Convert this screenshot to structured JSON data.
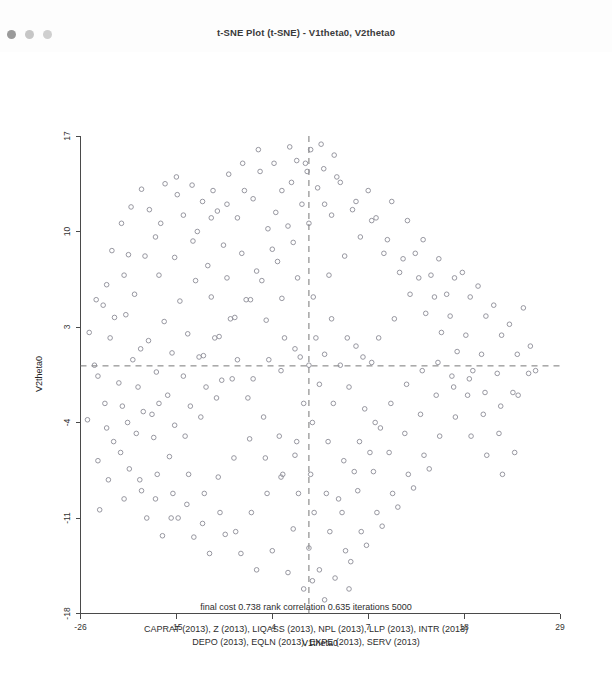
{
  "window": {
    "title": "t-SNE Plot (t-SNE) - V1theta0, V2theta0",
    "controls": [
      {
        "name": "close",
        "color": "#9a9a9a"
      },
      {
        "name": "minimize",
        "color": "#c6c6c6"
      },
      {
        "name": "maximize",
        "color": "#cfcfcf"
      }
    ]
  },
  "footer": {
    "stats_line": "final cost  0.738   rank correlation  0.635   iterations  5000",
    "variables_line_1": "CAPRAT (2013), Z (2013), LIQASS (2013), NPL (2013), LLP (2013), INTR (2013)",
    "variables_line_2": "DEPO (2013), EQLN (2013), EXPE (2013), SERV (2013)"
  },
  "chart_data": {
    "type": "scatter",
    "title": "t-SNE Plot (t-SNE) - V1theta0, V2theta0",
    "xlabel": "V1theta0",
    "ylabel": "V2theta0",
    "xlim": [
      -26,
      29
    ],
    "ylim": [
      -18,
      17
    ],
    "xticks": [
      -26,
      -15,
      -4,
      7,
      18,
      29
    ],
    "xticklabels": [
      "-26",
      "-15",
      "-4",
      "7",
      "18",
      "29"
    ],
    "yticks": [
      -18,
      -11,
      -4,
      3,
      10,
      17
    ],
    "yticklabels": [
      "-18",
      "-11",
      "-4",
      "3",
      "10",
      "17"
    ],
    "grid": false,
    "legend": null,
    "marker": "open-circle",
    "marker_color": "#8c8c96",
    "reference_lines": [
      {
        "orientation": "vertical",
        "x": 0.2,
        "style": "dashed"
      },
      {
        "orientation": "horizontal",
        "y": 0.15,
        "style": "dashed"
      }
    ],
    "annotations": [
      "final cost  0.738   rank correlation  0.635   iterations  5000",
      "CAPRAT (2013), Z (2013), LIQASS (2013), NPL (2013), LLP (2013), INTR (2013)",
      "DEPO (2013), EQLN (2013), EXPE (2013), SERV (2013)"
    ],
    "n_points": 268,
    "points": [
      [
        -19.0,
        13.1
      ],
      [
        -16.3,
        13.5
      ],
      [
        -21.3,
        10.6
      ],
      [
        -18.1,
        11.6
      ],
      [
        -14.9,
        12.7
      ],
      [
        -12.0,
        12.2
      ],
      [
        -10.3,
        11.5
      ],
      [
        -17.4,
        9.6
      ],
      [
        -20.5,
        8.3
      ],
      [
        -23.0,
        6.1
      ],
      [
        -22.1,
        3.7
      ],
      [
        -19.8,
        5.4
      ],
      [
        -17.0,
        6.8
      ],
      [
        -15.2,
        8.1
      ],
      [
        -13.1,
        9.3
      ],
      [
        -11.4,
        7.5
      ],
      [
        -9.6,
        9.0
      ],
      [
        -8.0,
        11.0
      ],
      [
        -6.2,
        12.4
      ],
      [
        -4.5,
        10.2
      ],
      [
        -2.9,
        13.0
      ],
      [
        -1.2,
        15.2
      ],
      [
        0.4,
        16.0
      ],
      [
        1.9,
        14.6
      ],
      [
        3.1,
        15.6
      ],
      [
        -0.6,
        12.0
      ],
      [
        -2.2,
        10.4
      ],
      [
        -4.0,
        8.7
      ],
      [
        -5.8,
        7.1
      ],
      [
        -7.5,
        8.4
      ],
      [
        -9.2,
        6.6
      ],
      [
        -11.0,
        5.2
      ],
      [
        -12.8,
        6.4
      ],
      [
        -14.6,
        4.9
      ],
      [
        -16.4,
        3.4
      ],
      [
        -18.2,
        2.0
      ],
      [
        -20.0,
        0.6
      ],
      [
        -21.6,
        -1.1
      ],
      [
        -23.2,
        -2.6
      ],
      [
        -24.4,
        0.2
      ],
      [
        -22.6,
        2.2
      ],
      [
        -20.8,
        3.9
      ],
      [
        -19.1,
        1.4
      ],
      [
        -17.3,
        -0.3
      ],
      [
        -15.5,
        1.1
      ],
      [
        -13.7,
        2.5
      ],
      [
        -11.9,
        0.9
      ],
      [
        -10.1,
        2.3
      ],
      [
        -8.3,
        3.7
      ],
      [
        -6.5,
        5.0
      ],
      [
        -4.7,
        3.5
      ],
      [
        -2.9,
        5.1
      ],
      [
        -1.1,
        6.6
      ],
      [
        0.7,
        5.2
      ],
      [
        2.5,
        6.8
      ],
      [
        4.3,
        8.2
      ],
      [
        6.1,
        9.6
      ],
      [
        7.9,
        11.0
      ],
      [
        9.7,
        12.2
      ],
      [
        11.5,
        10.8
      ],
      [
        13.3,
        9.4
      ],
      [
        15.1,
        8.0
      ],
      [
        16.9,
        6.6
      ],
      [
        18.7,
        5.2
      ],
      [
        20.5,
        3.8
      ],
      [
        22.3,
        2.4
      ],
      [
        24.1,
        1.0
      ],
      [
        25.4,
        -0.4
      ],
      [
        23.6,
        -1.8
      ],
      [
        21.8,
        -0.4
      ],
      [
        20.0,
        1.0
      ],
      [
        18.2,
        2.4
      ],
      [
        16.4,
        3.8
      ],
      [
        14.6,
        5.2
      ],
      [
        12.8,
        6.6
      ],
      [
        11.0,
        8.0
      ],
      [
        9.2,
        9.4
      ],
      [
        7.4,
        10.8
      ],
      [
        5.6,
        12.2
      ],
      [
        3.8,
        13.6
      ],
      [
        2.0,
        12.0
      ],
      [
        0.2,
        10.6
      ],
      [
        -1.6,
        9.2
      ],
      [
        -3.4,
        7.8
      ],
      [
        -5.2,
        6.4
      ],
      [
        -7.0,
        5.0
      ],
      [
        -8.8,
        3.6
      ],
      [
        -10.6,
        2.2
      ],
      [
        -12.4,
        0.8
      ],
      [
        -14.2,
        -0.6
      ],
      [
        -16.0,
        -2.0
      ],
      [
        -17.8,
        -3.4
      ],
      [
        -19.6,
        -4.8
      ],
      [
        -21.4,
        -6.2
      ],
      [
        -23.0,
        -4.4
      ],
      [
        -21.2,
        -2.8
      ],
      [
        -19.4,
        -1.4
      ],
      [
        -17.6,
        -5.1
      ],
      [
        -15.8,
        -6.5
      ],
      [
        -14.0,
        -5.0
      ],
      [
        -12.2,
        -3.6
      ],
      [
        -10.4,
        -2.2
      ],
      [
        -8.6,
        -0.8
      ],
      [
        -6.8,
        -2.2
      ],
      [
        -5.0,
        -3.6
      ],
      [
        -3.2,
        -5.0
      ],
      [
        -1.4,
        -6.4
      ],
      [
        0.4,
        -7.8
      ],
      [
        2.2,
        -9.2
      ],
      [
        4.0,
        -10.6
      ],
      [
        5.8,
        -9.0
      ],
      [
        7.6,
        -7.6
      ],
      [
        9.4,
        -6.2
      ],
      [
        11.2,
        -4.8
      ],
      [
        13.0,
        -3.4
      ],
      [
        14.8,
        -2.0
      ],
      [
        16.6,
        -0.6
      ],
      [
        18.4,
        -2.0
      ],
      [
        20.2,
        -3.4
      ],
      [
        22.0,
        -4.8
      ],
      [
        23.8,
        -6.2
      ],
      [
        22.4,
        -7.8
      ],
      [
        20.6,
        -6.4
      ],
      [
        18.8,
        -5.0
      ],
      [
        17.0,
        -3.6
      ],
      [
        15.2,
        -5.0
      ],
      [
        13.4,
        -6.4
      ],
      [
        11.6,
        -7.8
      ],
      [
        9.8,
        -9.2
      ],
      [
        8.0,
        -10.6
      ],
      [
        6.2,
        -12.0
      ],
      [
        4.4,
        -13.4
      ],
      [
        2.6,
        -12.0
      ],
      [
        0.8,
        -10.6
      ],
      [
        -1.0,
        -9.2
      ],
      [
        -2.8,
        -7.8
      ],
      [
        -4.6,
        -9.2
      ],
      [
        -6.4,
        -10.6
      ],
      [
        -8.2,
        -12.0
      ],
      [
        -10.0,
        -10.6
      ],
      [
        -11.8,
        -9.2
      ],
      [
        -13.6,
        -7.8
      ],
      [
        -15.4,
        -9.2
      ],
      [
        -17.2,
        -7.8
      ],
      [
        -19.0,
        -9.0
      ],
      [
        -20.4,
        -7.4
      ],
      [
        -18.4,
        -11.0
      ],
      [
        -16.6,
        -12.3
      ],
      [
        -14.8,
        -11.0
      ],
      [
        -13.0,
        -12.4
      ],
      [
        -11.2,
        -13.6
      ],
      [
        -9.4,
        -12.2
      ],
      [
        -7.6,
        -13.6
      ],
      [
        -5.8,
        -14.8
      ],
      [
        -4.0,
        -13.4
      ],
      [
        -2.2,
        -15.0
      ],
      [
        -0.4,
        -16.2
      ],
      [
        1.4,
        -14.8
      ],
      [
        3.2,
        -15.4
      ],
      [
        5.0,
        -14.2
      ],
      [
        6.8,
        -13.0
      ],
      [
        8.6,
        -11.6
      ],
      [
        10.4,
        -10.2
      ],
      [
        12.2,
        -8.8
      ],
      [
        14.0,
        -7.4
      ],
      [
        -24.0,
        -0.6
      ],
      [
        -25.0,
        2.6
      ],
      [
        -23.4,
        4.6
      ],
      [
        -21.0,
        6.8
      ],
      [
        -18.6,
        8.2
      ],
      [
        -16.8,
        10.6
      ],
      [
        -14.2,
        11.2
      ],
      [
        -12.6,
        10.0
      ],
      [
        -10.8,
        13.0
      ],
      [
        -9.0,
        14.2
      ],
      [
        -7.2,
        13.0
      ],
      [
        -5.4,
        14.4
      ],
      [
        -3.6,
        11.4
      ],
      [
        -1.8,
        13.6
      ],
      [
        0.0,
        14.4
      ],
      [
        1.6,
        16.4
      ],
      [
        3.4,
        14.0
      ],
      [
        5.2,
        11.6
      ],
      [
        7.0,
        13.0
      ],
      [
        8.8,
        8.4
      ],
      [
        10.6,
        7.0
      ],
      [
        12.4,
        8.4
      ],
      [
        14.2,
        6.8
      ],
      [
        16.0,
        5.4
      ],
      [
        17.8,
        7.0
      ],
      [
        19.6,
        6.0
      ],
      [
        21.4,
        4.6
      ],
      [
        23.2,
        3.2
      ],
      [
        24.8,
        4.4
      ],
      [
        19.0,
        -0.2
      ],
      [
        17.2,
        1.2
      ],
      [
        15.4,
        2.6
      ],
      [
        13.6,
        4.0
      ],
      [
        11.8,
        5.4
      ],
      [
        10.0,
        3.6
      ],
      [
        8.2,
        2.2
      ],
      [
        6.4,
        0.8
      ],
      [
        4.6,
        2.2
      ],
      [
        2.8,
        3.6
      ],
      [
        1.0,
        2.2
      ],
      [
        -0.8,
        0.8
      ],
      [
        -2.6,
        2.2
      ],
      [
        -4.4,
        0.6
      ],
      [
        -6.2,
        -0.8
      ],
      [
        -8.0,
        0.6
      ],
      [
        -9.8,
        -0.9
      ],
      [
        -11.6,
        -1.4
      ],
      [
        -13.4,
        -2.8
      ],
      [
        -15.2,
        -4.2
      ],
      [
        -17.0,
        -2.6
      ],
      [
        -18.8,
        -3.2
      ],
      [
        -20.6,
        -4.0
      ],
      [
        -22.2,
        -5.4
      ],
      [
        -24.0,
        -6.8
      ],
      [
        -22.8,
        -8.2
      ],
      [
        -21.0,
        -9.6
      ],
      [
        -19.2,
        -8.2
      ],
      [
        -17.4,
        -9.6
      ],
      [
        -15.6,
        -11.0
      ],
      [
        -13.8,
        -10.0
      ],
      [
        -12.0,
        -11.4
      ],
      [
        -10.2,
        -8.0
      ],
      [
        -8.4,
        -6.6
      ],
      [
        -6.6,
        -5.2
      ],
      [
        -4.8,
        -6.6
      ],
      [
        -3.0,
        -8.0
      ],
      [
        -1.2,
        -5.4
      ],
      [
        0.6,
        -4.0
      ],
      [
        2.4,
        -5.4
      ],
      [
        4.2,
        -6.8
      ],
      [
        6.0,
        -5.4
      ],
      [
        7.8,
        -4.0
      ],
      [
        9.6,
        -2.6
      ],
      [
        11.4,
        -1.2
      ],
      [
        13.2,
        -0.2
      ],
      [
        15.0,
        0.4
      ],
      [
        16.8,
        -1.4
      ],
      [
        18.6,
        -0.8
      ],
      [
        20.4,
        -1.8
      ],
      [
        22.2,
        -2.8
      ],
      [
        24.2,
        -2.0
      ],
      [
        25.6,
        1.6
      ],
      [
        26.2,
        -0.2
      ],
      [
        2.0,
        -17.0
      ],
      [
        0.6,
        -15.6
      ],
      [
        4.8,
        -16.2
      ],
      [
        -2.0,
        16.2
      ],
      [
        -0.2,
        15.0
      ],
      [
        1.2,
        13.2
      ],
      [
        2.8,
        11.2
      ],
      [
        -3.8,
        15.0
      ],
      [
        -5.6,
        16.0
      ],
      [
        -7.4,
        15.0
      ],
      [
        -9.2,
        12.0
      ],
      [
        -11.0,
        11.0
      ],
      [
        -13.2,
        13.4
      ],
      [
        -15.0,
        14.0
      ],
      [
        -20.2,
        11.8
      ],
      [
        -22.4,
        8.6
      ],
      [
        -24.2,
        5.0
      ],
      [
        -25.2,
        -3.8
      ],
      [
        -23.8,
        -10.4
      ],
      [
        -1.6,
        -11.8
      ],
      [
        0.2,
        -13.2
      ],
      [
        3.6,
        -9.6
      ],
      [
        5.4,
        -7.6
      ],
      [
        7.2,
        -6.2
      ],
      [
        -0.4,
        -2.6
      ],
      [
        1.4,
        -1.2
      ],
      [
        3.0,
        -2.6
      ],
      [
        4.8,
        -1.4
      ],
      [
        6.6,
        -3.0
      ],
      [
        8.4,
        -4.4
      ],
      [
        -3.0,
        -0.2
      ],
      [
        -1.4,
        1.4
      ],
      [
        0.2,
        0.2
      ],
      [
        2.0,
        1.0
      ],
      [
        3.8,
        0.2
      ],
      [
        5.6,
        1.6
      ],
      [
        7.4,
        0.4
      ]
    ]
  }
}
